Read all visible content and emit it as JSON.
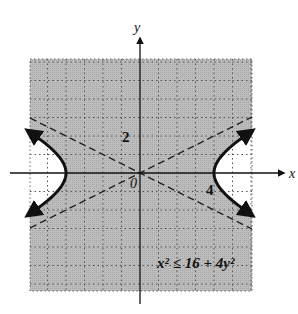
{
  "chart_data": {
    "type": "area",
    "title": "",
    "inequality": "x² ≤ 16 + 4y²",
    "xlabel": "x",
    "ylabel": "y",
    "tick_labels": {
      "x": [
        "4"
      ],
      "y": [
        "2"
      ],
      "origin": "0"
    },
    "xlim": [
      -6,
      6
    ],
    "ylim": [
      -6,
      6
    ],
    "grid": true,
    "boundary": {
      "curve": "hyperbola x^2 - 4y^2 = 16",
      "style": "solid",
      "vertices": [
        [
          -4,
          0
        ],
        [
          4,
          0
        ]
      ]
    },
    "asymptotes": [
      {
        "equation": "y = x/2",
        "style": "dashed"
      },
      {
        "equation": "y = -x/2",
        "style": "dashed"
      }
    ],
    "shaded_region": "between branches (x^2 <= 16 + 4y^2)",
    "colors": {
      "shade": "#b4b4b4",
      "curve": "#111111",
      "grid": "#555555"
    }
  }
}
